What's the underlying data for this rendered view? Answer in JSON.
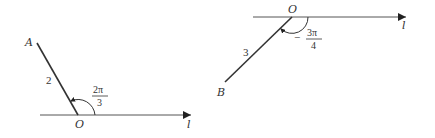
{
  "diagrams": [
    {
      "axis_label": "l",
      "origin_label": "O",
      "point_label": "A",
      "length_label": "2",
      "angle": {
        "sign": "",
        "numerator": "2π",
        "denominator": "3"
      }
    },
    {
      "axis_label": "l",
      "origin_label": "O",
      "point_label": "B",
      "length_label": "3",
      "angle": {
        "sign": "−",
        "numerator": "3π",
        "denominator": "4"
      }
    }
  ],
  "colors": {
    "stroke": "#333333",
    "axis": "#555555"
  }
}
